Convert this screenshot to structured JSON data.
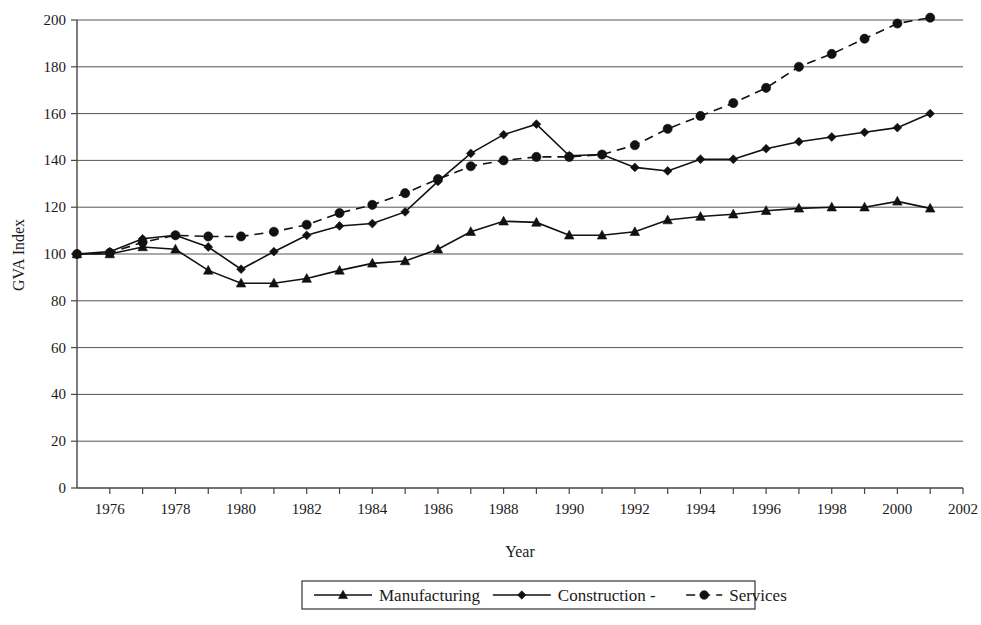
{
  "chart_data": {
    "type": "line",
    "title": "",
    "xlabel": "Year",
    "ylabel": "GVA Index",
    "xlim": [
      1975,
      2002
    ],
    "ylim": [
      0,
      200
    ],
    "ytick_step": 20,
    "yticks": [
      0,
      20,
      40,
      60,
      80,
      100,
      120,
      140,
      160,
      180,
      200
    ],
    "xticks_major": [
      1976,
      1978,
      1980,
      1982,
      1984,
      1986,
      1988,
      1990,
      1992,
      1994,
      1996,
      1998,
      2000,
      2002
    ],
    "xticks_minor_step": 1,
    "grid": "horizontal",
    "legend_position": "bottom",
    "x": [
      1975,
      1976,
      1977,
      1978,
      1979,
      1980,
      1981,
      1982,
      1983,
      1984,
      1985,
      1986,
      1987,
      1988,
      1989,
      1990,
      1991,
      1992,
      1993,
      1994,
      1995,
      1996,
      1997,
      1998,
      1999,
      2000,
      2001
    ],
    "series": [
      {
        "name": "Manufacturing",
        "marker": "triangle",
        "linestyle": "solid",
        "color": "#111111",
        "values": [
          100,
          100,
          103,
          102,
          93,
          87.5,
          87.5,
          89.5,
          93,
          96,
          97,
          102,
          109.5,
          114,
          113.5,
          108,
          108,
          109.5,
          114.5,
          116,
          117,
          118.5,
          119.5,
          120,
          120,
          122.5,
          119.5
        ]
      },
      {
        "name": "Construction",
        "marker": "diamond",
        "linestyle": "solid",
        "color": "#111111",
        "values": [
          100,
          101,
          106.5,
          108,
          103,
          93.5,
          101,
          108,
          112,
          113,
          118,
          131,
          143,
          151,
          155.5,
          142,
          142.5,
          137,
          135.5,
          140.5,
          140.5,
          145,
          148,
          150,
          152,
          154,
          160
        ]
      },
      {
        "name": "Services",
        "marker": "circle",
        "linestyle": "dashed",
        "color": "#111111",
        "values": [
          100,
          100.5,
          105,
          108,
          107.5,
          107.5,
          109.5,
          112.5,
          117.5,
          121,
          126,
          132,
          137.5,
          140,
          141.5,
          141.5,
          142.5,
          146.5,
          153.5,
          159,
          164.5,
          171,
          180,
          185.5,
          192,
          198.5,
          201
        ]
      }
    ]
  },
  "axis": {
    "y_title": "GVA Index",
    "x_title": "Year"
  },
  "legend": {
    "items": [
      {
        "label": "Manufacturing",
        "marker": "triangle",
        "dashed": false
      },
      {
        "label": "Construction -",
        "marker": "diamond",
        "dashed": false
      },
      {
        "label": "Services",
        "marker": "circle",
        "dashed": true
      }
    ]
  }
}
